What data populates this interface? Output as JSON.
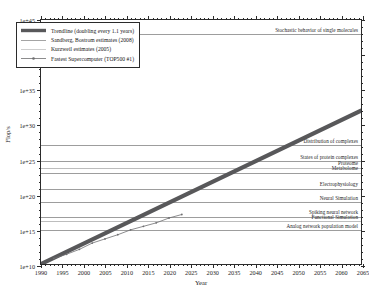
{
  "chart_data": {
    "type": "line",
    "title": "",
    "xlabel": "Year",
    "ylabel": "Flop/s",
    "xlim": [
      1990,
      2065
    ],
    "ylim": [
      10000000000.0,
      1e+45
    ],
    "yscale": "log",
    "xscale": "linear",
    "grid": true,
    "legend_position": "upper left",
    "xticks": [
      1990,
      1995,
      2000,
      2005,
      2010,
      2015,
      2020,
      2025,
      2030,
      2035,
      2040,
      2045,
      2050,
      2055,
      2060,
      2065
    ],
    "xtick_labels": [
      "1990",
      "1995",
      "2000",
      "2005",
      "2010",
      "2015",
      "2020",
      "2025",
      "2030",
      "2035",
      "2040",
      "2045",
      "2050",
      "2055",
      "2060",
      "2065"
    ],
    "yticks": [
      10000000000.0,
      1000000000000000.0,
      1e+20,
      1e+25,
      1e+30,
      1e+35,
      1e+40,
      1e+45
    ],
    "ytick_labels": [
      "1e+10",
      "1e+15",
      "1e+20",
      "1e+25",
      "1e+30",
      "1e+35",
      "1e+40",
      "1e+45"
    ],
    "series": [
      {
        "name": "Trendline (doubling every 1.1 years)",
        "style": "thick-solid",
        "color": "#58585a",
        "x": [
          1990,
          2065
        ],
        "y_exp": [
          10.0,
          32.0
        ]
      },
      {
        "name": "Fastest Supercomputer (TOP500 #1)",
        "style": "thin-solid-markers",
        "color": "#6e6e70",
        "x": [
          1993,
          1996,
          1999,
          2002,
          2005,
          2008,
          2011,
          2014,
          2017,
          2020,
          2023
        ],
        "y_exp": [
          10.8,
          11.4,
          12.1,
          13.0,
          13.6,
          14.2,
          14.9,
          15.4,
          15.9,
          16.6,
          17.1
        ]
      },
      {
        "name": "Sandberg, Bostrom estimates (2008)",
        "style": "thin-solid",
        "color": "#8d8d8d"
      },
      {
        "name": "Kurzweil estimates (2005)",
        "style": "thin-solid-light",
        "color": "#c2c2c2"
      }
    ],
    "reference_lines": [
      {
        "label": "Stochastic behavior of single molecules",
        "y_exp": 43.0,
        "align": "right",
        "shade": "normal"
      },
      {
        "label": "Distribution of complexes",
        "y_exp": 27.2,
        "align": "right",
        "shade": "normal"
      },
      {
        "label": "States of protein complexes",
        "y_exp": 24.9,
        "align": "right",
        "shade": "normal"
      },
      {
        "label": "Proteome",
        "y_exp": 24.0,
        "align": "right",
        "shade": "faint"
      },
      {
        "label": "Metabolome",
        "y_exp": 23.3,
        "align": "right",
        "shade": "normal"
      },
      {
        "label": "Electrophysiology",
        "y_exp": 21.0,
        "align": "right",
        "shade": "normal"
      },
      {
        "label": "Neural Simulation",
        "y_exp": 19.1,
        "align": "right",
        "shade": "normal"
      },
      {
        "label": "Spiking neural network",
        "y_exp": 17.0,
        "align": "right",
        "shade": "normal"
      },
      {
        "label": "Functional Simulation",
        "y_exp": 16.4,
        "align": "right",
        "shade": "faint"
      },
      {
        "label": "Analog network population model",
        "y_exp": 15.1,
        "align": "right",
        "shade": "normal"
      }
    ]
  },
  "legend": {
    "entries": [
      {
        "label": "Trendline (doubling every 1.1 years)"
      },
      {
        "label": "Sandberg, Bostrom estimates (2008)"
      },
      {
        "label": "Kurzweil estimates (2005)"
      },
      {
        "label": "Fastest Supercomputer (TOP500 #1)"
      }
    ]
  }
}
